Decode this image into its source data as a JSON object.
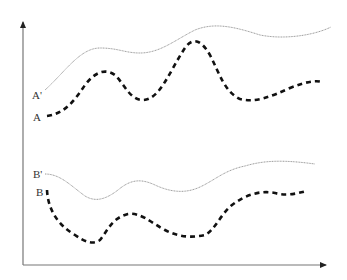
{
  "diagram": {
    "type": "schematic-curves",
    "axes": {
      "x_axis": "unlabeled horizontal axis with arrow",
      "y_axis": "unlabeled vertical axis with arrow"
    },
    "curves": [
      {
        "id": "A_prime",
        "label": "A'",
        "style": "thin dotted",
        "color": "#999999"
      },
      {
        "id": "A",
        "label": "A",
        "style": "thick dashed",
        "color": "#111111"
      },
      {
        "id": "B_prime",
        "label": "B'",
        "style": "thin dotted",
        "color": "#999999"
      },
      {
        "id": "B",
        "label": "B",
        "style": "thick dashed",
        "color": "#111111"
      }
    ]
  },
  "labels": {
    "a_prime": "A'",
    "a": "A",
    "b_prime": "B'",
    "b": "B"
  }
}
